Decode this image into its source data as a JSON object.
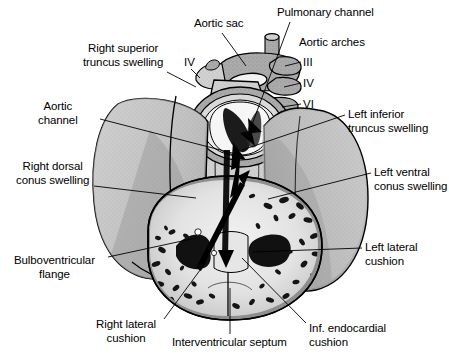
{
  "figure": {
    "background_color": "#ffffff",
    "line_color": "#000000",
    "width": 449,
    "height": 360,
    "shading": {
      "myocardium_gray": "#8e8e8e",
      "mid_gray": "#a8a8a8",
      "light_gray": "#c9c9c9",
      "pale": "#e8e8e8",
      "lumen_white": "#f4f4f4",
      "trabeculae_black": "#1a1a1a",
      "outline": "#000000"
    }
  },
  "labels": [
    {
      "id": "aortic-sac",
      "text": "Aortic sac",
      "lines": [
        "Aortic sac"
      ],
      "align": "center",
      "x": 194,
      "y": 17,
      "leader": {
        "x1": 222,
        "y1": 33,
        "x2": 246,
        "y2": 66
      }
    },
    {
      "id": "pulmonary-channel",
      "text": "Pulmonary channel",
      "lines": [
        "Pulmonary channel"
      ],
      "align": "left",
      "x": 277,
      "y": 6,
      "leader": {
        "x1": 290,
        "y1": 22,
        "x2": 250,
        "y2": 130
      }
    },
    {
      "id": "aortic-arches",
      "text": "Aortic arches",
      "lines": [
        "Aortic arches"
      ],
      "align": "left",
      "x": 299,
      "y": 36,
      "leader": null
    },
    {
      "id": "right-superior-truncus-swelling",
      "text": "Right superior truncus swelling",
      "lines": [
        "Right superior",
        "truncus swelling"
      ],
      "align": "center",
      "x": 83,
      "y": 42,
      "leader": {
        "x1": 167,
        "y1": 72,
        "x2": 196,
        "y2": 87
      }
    },
    {
      "id": "aortic-channel",
      "text": "Aortic channel",
      "lines": [
        "Aortic",
        "channel"
      ],
      "align": "center",
      "x": 38,
      "y": 100,
      "leader": {
        "x1": 100,
        "y1": 119,
        "x2": 240,
        "y2": 155
      }
    },
    {
      "id": "right-dorsal-conus-swelling",
      "text": "Right dorsal conus swelling",
      "lines": [
        "Right dorsal",
        "conus swelling"
      ],
      "align": "center",
      "x": 16,
      "y": 160,
      "leader": {
        "x1": 94,
        "y1": 186,
        "x2": 196,
        "y2": 198
      }
    },
    {
      "id": "bulboventricular-flange",
      "text": "Bulboventricular flange",
      "lines": [
        "Bulboventricular",
        "flange"
      ],
      "align": "center",
      "x": 14,
      "y": 254,
      "leader": {
        "x1": 108,
        "y1": 257,
        "x2": 196,
        "y2": 238
      }
    },
    {
      "id": "right-lateral-cushion",
      "text": "Right lateral cushion",
      "lines": [
        "Right lateral",
        "cushion"
      ],
      "align": "center",
      "x": 96,
      "y": 318,
      "leader": {
        "x1": 164,
        "y1": 319,
        "x2": 206,
        "y2": 262
      }
    },
    {
      "id": "interventricular-septum",
      "text": "Interventricular septum",
      "lines": [
        "Interventricular septum"
      ],
      "align": "center",
      "x": 172,
      "y": 336,
      "leader": {
        "x1": 230,
        "y1": 334,
        "x2": 230,
        "y2": 288
      }
    },
    {
      "id": "inf-endocardial-cushion",
      "text": "Inf. endocardial cushion",
      "lines": [
        "Inf. endocardial",
        "cushion"
      ],
      "align": "left",
      "x": 309,
      "y": 322,
      "leader": {
        "x1": 306,
        "y1": 323,
        "x2": 242,
        "y2": 258
      }
    },
    {
      "id": "left-lateral-cushion",
      "text": "Left lateral cushion",
      "lines": [
        "Left lateral",
        "cushion"
      ],
      "align": "left",
      "x": 365,
      "y": 241,
      "leader": {
        "x1": 362,
        "y1": 248,
        "x2": 252,
        "y2": 252
      }
    },
    {
      "id": "left-ventral-conus-swelling",
      "text": "Left ventral conus swelling",
      "lines": [
        "Left ventral",
        "conus swelling"
      ],
      "align": "left",
      "x": 374,
      "y": 166,
      "leader": {
        "x1": 371,
        "y1": 173,
        "x2": 268,
        "y2": 199
      }
    },
    {
      "id": "left-inferior-truncus-swelling",
      "text": "Left inferior truncus swelling",
      "lines": [
        "Left inferior",
        "truncus swelling"
      ],
      "align": "left",
      "x": 348,
      "y": 108,
      "leader": {
        "x1": 345,
        "y1": 115,
        "x2": 242,
        "y2": 150
      }
    }
  ],
  "arch_numerals": [
    {
      "id": "arch-iv-left-side",
      "text": "IV",
      "x": 184,
      "y": 56,
      "leader": {
        "x1": 191,
        "y1": 69,
        "x2": 200,
        "y2": 78
      }
    },
    {
      "id": "arch-iii",
      "text": "III",
      "x": 303,
      "y": 56,
      "leader": {
        "x1": 301,
        "y1": 62,
        "x2": 285,
        "y2": 66
      }
    },
    {
      "id": "arch-iv",
      "text": "IV",
      "x": 303,
      "y": 77,
      "leader": {
        "x1": 301,
        "y1": 83,
        "x2": 284,
        "y2": 87
      }
    },
    {
      "id": "arch-vi",
      "text": "VI",
      "x": 303,
      "y": 98,
      "leader": {
        "x1": 301,
        "y1": 104,
        "x2": 282,
        "y2": 107
      }
    }
  ],
  "flow_arrows": [
    {
      "id": "aortic-flow-arrow",
      "description": "arrow through aortic channel"
    },
    {
      "id": "pulmonary-flow-arrow",
      "description": "arrow through pulmonary channel"
    }
  ]
}
